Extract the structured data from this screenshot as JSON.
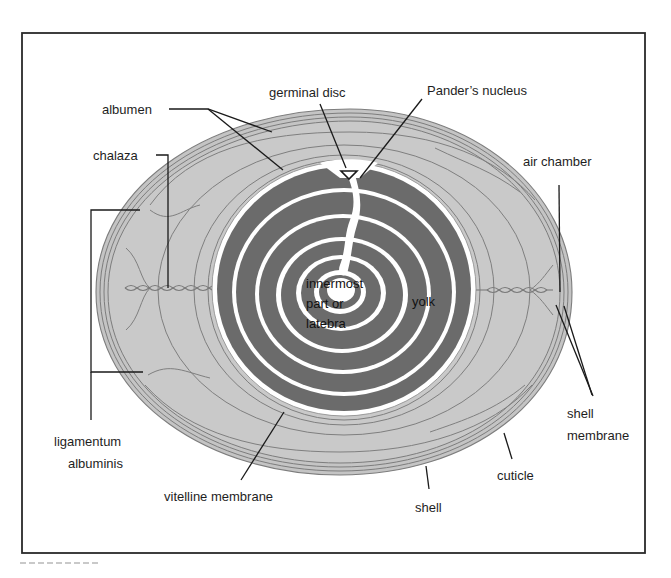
{
  "figure": {
    "colors": {
      "frame": "#2a2a2a",
      "shell": "#bdbdbd",
      "albumen": "#c9c9c9",
      "outline": "#7a7a7a",
      "yolk_dark": "#6b6b6b",
      "yolk_light": "#ffffff",
      "leader": "#1a1a1a"
    }
  },
  "labels": {
    "albumen": "albumen",
    "chalaza": "chalaza",
    "germinal_disc": "germinal disc",
    "panders_nucleus": "Pander’s nucleus",
    "air_chamber": "air chamber",
    "innermost": {
      "line1": "innermost",
      "line2": "part or",
      "line3": "latebra"
    },
    "yolk": "yolk",
    "ligamentum": {
      "line1": "ligamentum",
      "line2": "albuminis"
    },
    "shell_membrane": {
      "line1": "shell",
      "line2": "membrane"
    },
    "vitelline_membrane": "vitelline membrane",
    "cuticle": "cuticle",
    "shell": "shell"
  }
}
